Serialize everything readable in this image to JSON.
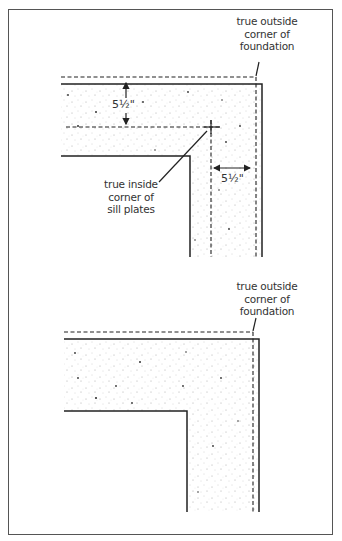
{
  "figure": {
    "top_panel": {
      "outside_corner_label": "true outside\ncorner of\nfoundation",
      "inside_corner_label": "true inside\ncorner of\nsill plates",
      "vertical_dimension": "5½\"",
      "horizontal_dimension": "5½\""
    },
    "bottom_panel": {
      "outside_corner_label": "true outside\ncorner of\nfoundation"
    },
    "colors": {
      "line": "#2a2a2a",
      "frame": "#555555",
      "text": "#333333",
      "stipple": "#888888"
    }
  }
}
